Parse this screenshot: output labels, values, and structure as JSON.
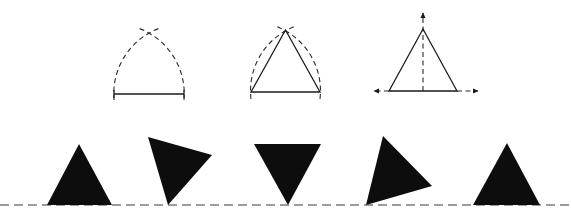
{
  "diagram": {
    "colors": {
      "ink": "#0d0d0d",
      "background": "#ffffff"
    },
    "construction_steps": [
      {
        "id": "step-1",
        "label": "base segment with two intersecting arcs"
      },
      {
        "id": "step-2",
        "label": "equilateral triangle drawn through arc intersection"
      },
      {
        "id": "step-3",
        "label": "triangle with dashed axis of symmetry and extended base arrows"
      }
    ],
    "rolling_triangles": [
      {
        "id": "tri-1",
        "orientation": "upright"
      },
      {
        "id": "tri-2",
        "orientation": "rotated clockwise, resting on vertex"
      },
      {
        "id": "tri-3",
        "orientation": "inverted, resting on vertex"
      },
      {
        "id": "tri-4",
        "orientation": "rotated, resting on vertex"
      },
      {
        "id": "tri-5",
        "orientation": "upright"
      }
    ],
    "baseline": {
      "style": "dashed"
    }
  }
}
